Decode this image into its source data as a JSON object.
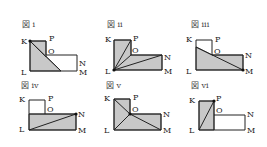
{
  "figures": [
    {
      "id": "i",
      "title": "図 i",
      "vertex_labels": {
        "K": "K",
        "P": "P",
        "O": "O",
        "N": "N",
        "M": "M",
        "L": "L"
      },
      "moving_point": "K",
      "shaded_description": "triangle from K to L to a point on LM",
      "segments_from_point": [
        "K-LM"
      ]
    },
    {
      "id": "ii",
      "title": "図 ii",
      "vertex_labels": {
        "K": "K",
        "P": "P",
        "O": "O",
        "N": "N",
        "M": "M",
        "L": "L"
      },
      "moving_point": "L",
      "shaded_description": "whole L-shaped region divided by segments from L to P, O, N",
      "segments_from_point": [
        "L-P",
        "L-O",
        "L-N"
      ]
    },
    {
      "id": "iii",
      "title": "図 iii",
      "vertex_labels": {
        "K": "K",
        "P": "P",
        "O": "O",
        "N": "N",
        "M": "M",
        "L": "L"
      },
      "moving_point": "M",
      "shaded_description": "region below segment from a point on KL to M",
      "segments_from_point": [
        "M-KL"
      ]
    },
    {
      "id": "iv",
      "title": "図 iv",
      "vertex_labels": {
        "K": "K",
        "P": "P",
        "O": "O",
        "N": "N",
        "M": "M",
        "L": "L"
      },
      "moving_point": "N",
      "shaded_description": "lower rectangle divided by diagonal L-N",
      "segments_from_point": [
        "N-L"
      ]
    },
    {
      "id": "v",
      "title": "図 v",
      "vertex_labels": {
        "K": "K",
        "P": "P",
        "O": "O",
        "N": "N",
        "M": "M",
        "L": "L"
      },
      "moving_point": "O",
      "shaded_description": "whole region divided by segments from O to K, L, M",
      "segments_from_point": [
        "O-K",
        "O-L",
        "O-M"
      ]
    },
    {
      "id": "vi",
      "title": "図 vi",
      "vertex_labels": {
        "K": "K",
        "P": "P",
        "O": "O",
        "N": "N",
        "M": "M",
        "L": "L"
      },
      "moving_point": "P",
      "shaded_description": "left rectangle K-P-O'-L divided by segment P-L",
      "segments_from_point": [
        "P-L"
      ]
    }
  ]
}
